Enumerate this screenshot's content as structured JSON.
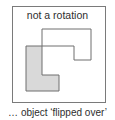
{
  "diagram": {
    "title": "not a rotation",
    "caption": "… object ‘flipped over’",
    "colors": {
      "frame_stroke": "#7a7a7a",
      "shape_stroke": "#6e6e6e",
      "filled_shape_fill": "#d9d9d9",
      "outline_shape_fill": "none",
      "text": "#2e2e2e"
    },
    "shapes": [
      {
        "name": "filled-l-shape",
        "filled": true,
        "points": "26,46 42,46 42,75 59,75 59,91 26,91"
      },
      {
        "name": "outline-flipped-shape",
        "filled": false,
        "points": "42,29 91,29 91,60 74,60 74,46 42,46"
      }
    ]
  }
}
